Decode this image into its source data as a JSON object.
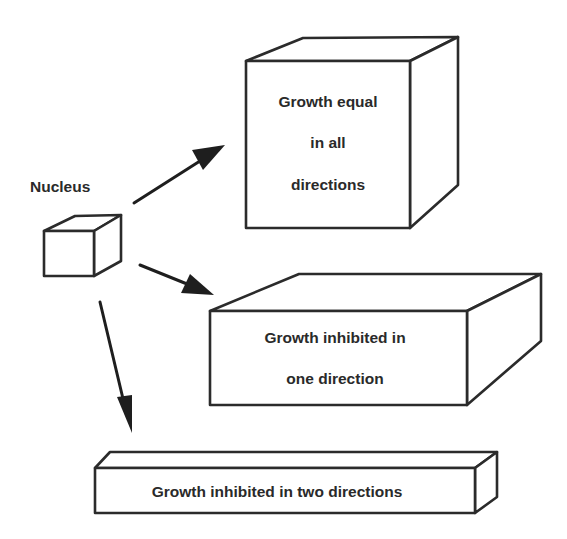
{
  "diagram": {
    "colors": {
      "stroke": "#2b2b2b",
      "text": "#2a2a2a",
      "background": "#ffffff"
    },
    "nucleus": {
      "label": "Nucleus"
    },
    "outcomes": [
      {
        "id": "equal",
        "lines": [
          "Growth equal",
          "in all",
          "directions"
        ]
      },
      {
        "id": "one-direction",
        "lines": [
          "Growth inhibited in",
          "one direction"
        ]
      },
      {
        "id": "two-directions",
        "lines": [
          "Growth inhibited in two directions"
        ]
      }
    ],
    "arrows": [
      {
        "from": "nucleus",
        "to": "equal"
      },
      {
        "from": "nucleus",
        "to": "one-direction"
      },
      {
        "from": "nucleus",
        "to": "two-directions"
      }
    ]
  }
}
